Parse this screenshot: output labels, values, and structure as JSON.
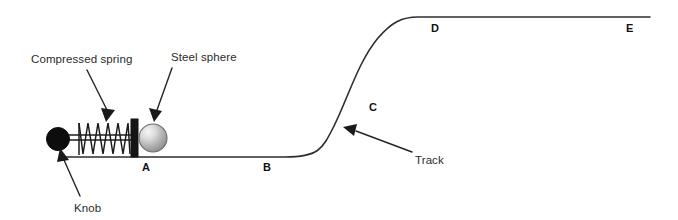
{
  "diagram": {
    "background_color": "#ffffff",
    "line_color": "#2e2e2e",
    "callouts": [
      {
        "id": "compressed-spring",
        "label": "Compressed spring"
      },
      {
        "id": "steel-sphere",
        "label": "Steel sphere"
      },
      {
        "id": "knob",
        "label": "Knob"
      },
      {
        "id": "track",
        "label": "Track"
      }
    ],
    "point_labels": [
      {
        "id": "A",
        "label": "A"
      },
      {
        "id": "B",
        "label": "B"
      },
      {
        "id": "C",
        "label": "C"
      },
      {
        "id": "D",
        "label": "D"
      },
      {
        "id": "E",
        "label": "E"
      }
    ],
    "parts": {
      "knob": {
        "name": "knob",
        "color": "#0d0d0d"
      },
      "rod": {
        "name": "push-rod",
        "color": "#1c1c1c"
      },
      "spring": {
        "name": "compressed-spring",
        "color": "#1c1c1c",
        "coils": 10
      },
      "block": {
        "name": "spring-plate",
        "color": "#151515"
      },
      "sphere": {
        "name": "steel-sphere",
        "highlight_color": "#f2f2f2",
        "body_color": "#9c9c9c",
        "edge_color": "#6d6d6d"
      },
      "track": {
        "name": "track",
        "color": "#2e2e2e"
      }
    }
  }
}
